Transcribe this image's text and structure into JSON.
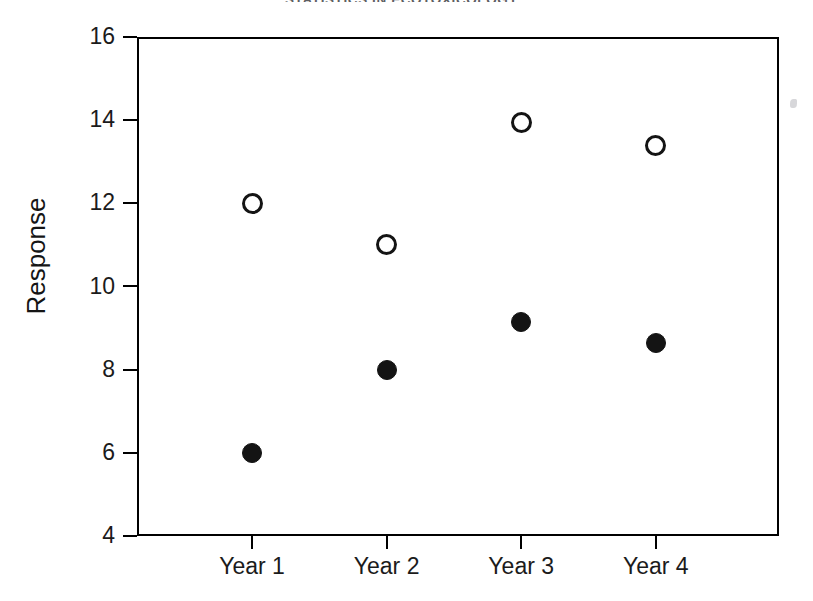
{
  "page": {
    "running_head": "STATISTICS IN ECOTOXICOLOGY",
    "background_color": "#ffffff",
    "ink_color": "#141414"
  },
  "chart_data": {
    "type": "scatter",
    "title": "",
    "xlabel": "",
    "ylabel": "Response",
    "categories": [
      "Year 1",
      "Year 2",
      "Year 3",
      "Year 4"
    ],
    "ylim": [
      4,
      16
    ],
    "yticks": [
      4,
      6,
      8,
      10,
      12,
      14,
      16
    ],
    "ytick_labels": [
      "4",
      "6",
      "8",
      "10",
      "12",
      "14",
      "16"
    ],
    "grid": false,
    "legend": "none",
    "series": [
      {
        "name": "open-circle-series",
        "marker": "open-circle",
        "color": "#141414",
        "values": [
          12.0,
          11.0,
          13.95,
          13.4
        ]
      },
      {
        "name": "filled-circle-series",
        "marker": "filled-circle",
        "color": "#141414",
        "values": [
          6.0,
          8.0,
          9.15,
          8.65
        ]
      }
    ]
  }
}
